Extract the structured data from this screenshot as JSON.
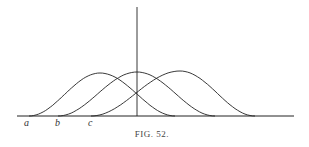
{
  "figure": {
    "caption": "Fig. 52.",
    "caption_display": "FIG. 52."
  },
  "axes": {
    "baseline": {
      "x1": 17,
      "x2": 294,
      "y": 116
    },
    "vertical": {
      "x": 137,
      "y1": 7,
      "y2": 116
    }
  },
  "curves": [
    {
      "id": "a",
      "label": "a",
      "start_x": 29,
      "peak_x": 100,
      "peak_y": 73,
      "end_x": 175
    },
    {
      "id": "b",
      "label": "b",
      "start_x": 58,
      "peak_x": 137,
      "peak_y": 72,
      "end_x": 215
    },
    {
      "id": "c",
      "label": "c",
      "start_x": 91,
      "peak_x": 180,
      "peak_y": 71,
      "end_x": 255
    }
  ],
  "labels": [
    {
      "text": "a",
      "x": 24,
      "y": 126
    },
    {
      "text": "b",
      "x": 55,
      "y": 126
    },
    {
      "text": "c",
      "x": 88,
      "y": 126
    }
  ],
  "colors": {
    "line": "#222222",
    "background": "#ffffff"
  }
}
